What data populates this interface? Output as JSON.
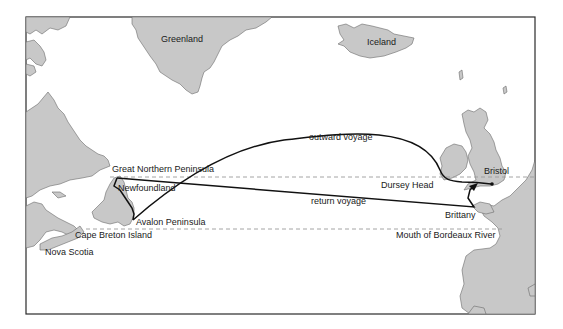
{
  "map": {
    "labels": {
      "greenland": "Greenland",
      "iceland": "Iceland",
      "outward_voyage": "outward voyage",
      "return_voyage": "return voyage",
      "great_northern_peninsula": "Great Northern Peninsula",
      "newfoundland": "Newfoundland",
      "avalon_peninsula": "Avalon Peninsula",
      "cape_breton_island": "Cape Breton Island",
      "nova_scotia": "Nova Scotia",
      "dursey_head": "Dursey Head",
      "bristol": "Bristol",
      "brittany": "Brittany",
      "mouth_of_bordeaux_river": "Mouth of Bordeaux River"
    },
    "colors": {
      "land": "#c8c8c8",
      "coast": "#6a6a6a",
      "route": "#111111",
      "latitude_line": "#9a9a9a",
      "frame": "#2a2a2a"
    }
  }
}
